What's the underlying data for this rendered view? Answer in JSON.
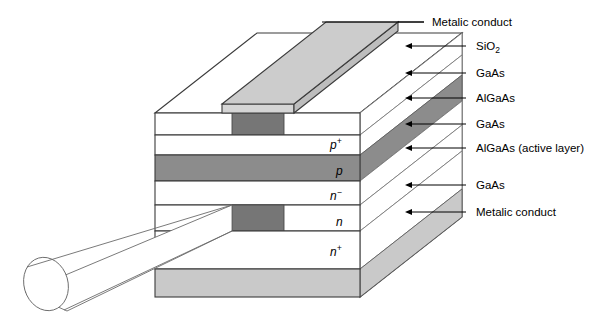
{
  "figure": {
    "background_color": "#ffffff"
  },
  "colors": {
    "outline": "#3b3b3b",
    "dark_gray": "#767676",
    "mid_gray": "#8c8c8c",
    "light_gray": "#c9c9c9",
    "pale_gray": "#d5d5d5",
    "white": "#ffffff",
    "text": "#000000",
    "beam_outline": "#6b6b6b"
  },
  "callouts": [
    {
      "id": "callout-metalic-conduct-top",
      "label": "Metalic conduct",
      "arrow": false,
      "x": 432,
      "y": 22,
      "line_x1": 322,
      "line_x2": 424
    },
    {
      "id": "callout-sio2",
      "label": "SiO",
      "sub": "2",
      "arrow": true,
      "x": 432,
      "y": 48,
      "line_x1": 412,
      "line_x2": 424
    },
    {
      "id": "callout-gaas-1",
      "label": "GaAs",
      "arrow": true,
      "x": 432,
      "y": 74,
      "line_x1": 412,
      "line_x2": 424
    },
    {
      "id": "callout-algaas-1",
      "label": "AlGaAs",
      "arrow": true,
      "x": 432,
      "y": 99,
      "line_x1": 412,
      "line_x2": 424
    },
    {
      "id": "callout-gaas-2",
      "label": "GaAs",
      "arrow": true,
      "x": 432,
      "y": 124,
      "line_x1": 412,
      "line_x2": 424
    },
    {
      "id": "callout-algaas-active",
      "label": "AlGaAs (active layer)",
      "arrow": true,
      "x": 432,
      "y": 149,
      "line_x1": 412,
      "line_x2": 424
    },
    {
      "id": "callout-gaas-3",
      "label": "GaAs",
      "arrow": true,
      "x": 432,
      "y": 186,
      "line_x1": 412,
      "line_x2": 424
    },
    {
      "id": "callout-metalic-conduct-bottom",
      "label": "Metalic conduct",
      "arrow": true,
      "x": 432,
      "y": 213,
      "line_x1": 412,
      "line_x2": 424
    }
  ],
  "layer_labels": [
    {
      "id": "layer-label-p-plus",
      "base": "p",
      "sup": "+",
      "x": 330,
      "y": 139
    },
    {
      "id": "layer-label-p",
      "base": "p",
      "sup": "",
      "x": 336,
      "y": 166
    },
    {
      "id": "layer-label-n-minus",
      "base": "n",
      "sup": "−",
      "x": 330,
      "y": 192
    },
    {
      "id": "layer-label-n",
      "base": "n",
      "sup": "",
      "x": 336,
      "y": 219
    },
    {
      "id": "layer-label-n-plus",
      "base": "n",
      "sup": "+",
      "x": 330,
      "y": 248
    }
  ],
  "front_face": {
    "x_left": 155,
    "x_right": 360,
    "y_top": 113,
    "y_bottom": 297,
    "layers": [
      {
        "id": "front-layer-sio2",
        "name": "SiO2 layer",
        "y": 113,
        "h": 22,
        "fill": "white",
        "has_window": true,
        "window_x": 232,
        "window_w": 52,
        "window_fill": "dark_gray"
      },
      {
        "id": "front-layer-gaas-p-plus",
        "name": "GaAs p+ cap",
        "y": 135,
        "h": 20,
        "fill": "white"
      },
      {
        "id": "front-layer-algaas-p",
        "name": "AlGaAs p confinement",
        "y": 155,
        "h": 26,
        "fill": "mid_gray"
      },
      {
        "id": "front-layer-gaas-n-minus",
        "name": "GaAs n- active",
        "y": 181,
        "h": 24,
        "fill": "white"
      },
      {
        "id": "front-layer-algaas-n",
        "name": "AlGaAs n confinement",
        "y": 205,
        "h": 26,
        "fill": "white",
        "has_window": true,
        "window_x": 232,
        "window_w": 52,
        "window_fill": "dark_gray"
      },
      {
        "id": "front-layer-gaas-n-plus",
        "name": "GaAs n+ substrate",
        "y": 231,
        "h": 38,
        "fill": "white"
      },
      {
        "id": "front-layer-metal-bottom",
        "name": "Bottom metalic conduct",
        "y": 269,
        "h": 28,
        "fill": "light_gray"
      }
    ]
  },
  "top_contact": {
    "id": "top-metalic-strip",
    "name": "Top metalic conduct strip",
    "fill": "light_gray",
    "edge_fill": "pale_gray"
  },
  "light_beam": {
    "id": "emitted-light-beam",
    "name": "emitted laser beam",
    "ellipse_cx": 46,
    "ellipse_cy": 284,
    "ellipse_rx": 22,
    "ellipse_ry": 27
  }
}
